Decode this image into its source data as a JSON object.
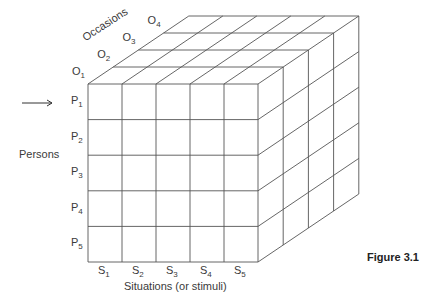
{
  "diagram": {
    "type": "data-cube",
    "axes": {
      "persons": {
        "label": "Persons",
        "items": [
          {
            "base": "P",
            "sub": "1"
          },
          {
            "base": "P",
            "sub": "2"
          },
          {
            "base": "P",
            "sub": "3"
          },
          {
            "base": "P",
            "sub": "4"
          },
          {
            "base": "P",
            "sub": "5"
          }
        ]
      },
      "situations": {
        "label": "Situations (or stimuli)",
        "items": [
          {
            "base": "S",
            "sub": "1"
          },
          {
            "base": "S",
            "sub": "2"
          },
          {
            "base": "S",
            "sub": "3"
          },
          {
            "base": "S",
            "sub": "4"
          },
          {
            "base": "S",
            "sub": "5"
          }
        ]
      },
      "occasions": {
        "label": "Occasions",
        "items": [
          {
            "base": "O",
            "sub": "1"
          },
          {
            "base": "O",
            "sub": "2"
          },
          {
            "base": "O",
            "sub": "3"
          },
          {
            "base": "O",
            "sub": "4"
          }
        ]
      }
    },
    "arrow": "→",
    "caption": "Figure 3.1",
    "line_color": "#555555"
  }
}
